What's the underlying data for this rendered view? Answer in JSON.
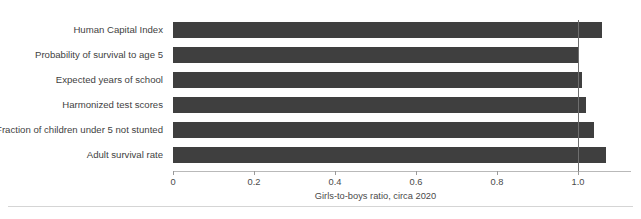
{
  "figure": {
    "title": "Figure 1. Gender gaps in human capital components (girls-to-boys ratio)",
    "axis_title": "Girls-to-boys ratio, circa 2020",
    "bar_color": "#3f3f3f",
    "reference_line_value": "1.0",
    "reference_line_color": "#6e6e6e"
  },
  "chart_data": {
    "type": "bar",
    "orientation": "horizontal",
    "title": "Figure 1. Gender gaps in human capital components (girls-to-boys ratio)",
    "xlabel": "Girls-to-boys ratio, circa 2020",
    "ylabel": "",
    "xlim": [
      0,
      1.13
    ],
    "xticks": [
      0,
      0.2,
      0.4,
      0.6,
      0.8,
      1.0
    ],
    "xticklabels": [
      "0",
      "0.2",
      "0.4",
      "0.6",
      "0.8",
      "1.0"
    ],
    "grid": false,
    "legend": false,
    "reference_lines": [
      1.0
    ],
    "categories": [
      "Human Capital Index",
      "Probability of survival to age 5",
      "Expected years of school",
      "Harmonized test scores",
      "Fraction of children under 5 not stunted",
      "Adult survival rate"
    ],
    "values": [
      1.06,
      1.0,
      1.01,
      1.02,
      1.04,
      1.07
    ]
  }
}
